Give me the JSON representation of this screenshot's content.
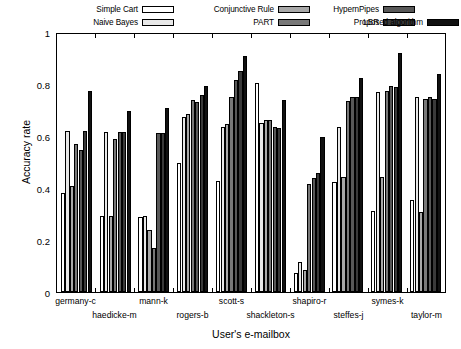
{
  "chart_data": {
    "type": "bar",
    "title": "",
    "xlabel": "User's e-mailbox",
    "ylabel": "Accuracy rate",
    "ylim": [
      0,
      1
    ],
    "yticks": [
      "0",
      "0.2",
      "0.4",
      "0.6",
      "0.8",
      "1"
    ],
    "ytick_values": [
      0,
      0.2,
      0.4,
      0.6,
      0.8,
      1
    ],
    "grid": false,
    "legend_position": "top",
    "categories": [
      "germany-c",
      "haedicke-m",
      "mann-k",
      "rogers-b",
      "scott-s",
      "shackleton-s",
      "shapiro-r",
      "steffes-j",
      "symes-k",
      "taylor-m"
    ],
    "series": [
      {
        "name": "Simple Cart",
        "color": "#ffffff",
        "values": [
          0.385,
          0.295,
          0.29,
          0.5,
          0.43,
          0.81,
          0.075,
          0.425,
          0.315,
          0.355
        ]
      },
      {
        "name": "Naive Bayes",
        "color": "#e8e8e8",
        "values": [
          0.625,
          0.62,
          0.295,
          0.68,
          0.64,
          0.655,
          0.115,
          0.64,
          0.775,
          0.755
        ]
      },
      {
        "name": "Conjunctive Rule",
        "color": "#a8a8a8",
        "values": [
          0.41,
          0.295,
          0.24,
          0.69,
          0.65,
          0.665,
          0.085,
          0.445,
          0.445,
          0.31
        ]
      },
      {
        "name": "PART",
        "color": "#787878",
        "values": [
          0.575,
          0.595,
          0.17,
          0.745,
          0.755,
          0.665,
          0.42,
          0.74,
          0.78,
          0.75
        ]
      },
      {
        "name": "HypernPipes",
        "color": "#585858",
        "values": [
          0.55,
          0.62,
          0.615,
          0.735,
          0.82,
          0.64,
          0.44,
          0.755,
          0.8,
          0.755
        ]
      },
      {
        "name": "LBR",
        "color": "#3a3a3a",
        "values": [
          0.625,
          0.62,
          0.615,
          0.765,
          0.855,
          0.635,
          0.46,
          0.755,
          0.795,
          0.75
        ]
      },
      {
        "name": "Proposed algorithm",
        "color": "#111111",
        "values": [
          0.78,
          0.7,
          0.715,
          0.8,
          0.915,
          0.745,
          0.6,
          0.83,
          0.925,
          0.845
        ]
      }
    ]
  },
  "legend": {
    "columns": [
      {
        "items": [
          {
            "label": "Simple Cart",
            "color": "#ffffff"
          },
          {
            "label": "Naive Bayes",
            "color": "#e8e8e8"
          }
        ]
      },
      {
        "items": [
          {
            "label": "Conjunctive Rule",
            "color": "#a8a8a8"
          },
          {
            "label": "PART",
            "color": "#787878"
          }
        ]
      },
      {
        "items": [
          {
            "label": "HypernPipes",
            "color": "#585858"
          },
          {
            "label": "LBR",
            "color": "#3a3a3a"
          }
        ]
      },
      {
        "items": [
          {
            "label": "Proposed algorithm",
            "color": "#111111"
          }
        ]
      }
    ]
  }
}
